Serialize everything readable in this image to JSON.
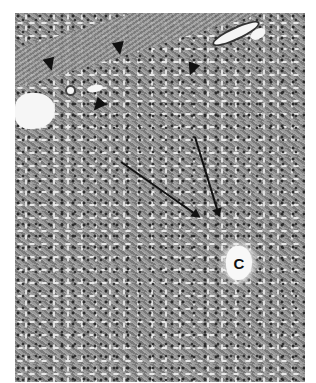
{
  "image": {
    "type": "histology micrograph",
    "tone": "grayscale",
    "annotations": {
      "central_vein_label": "C",
      "arrowheads_count": 4,
      "arrows_count": 2
    }
  }
}
